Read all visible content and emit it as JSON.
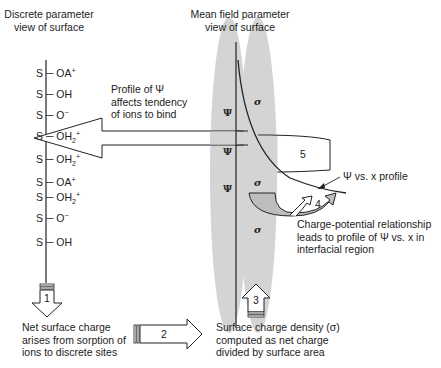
{
  "headers": {
    "discrete": [
      "Discrete parameter",
      "view of surface"
    ],
    "mean_field": [
      "Mean field parameter",
      "view of surface"
    ]
  },
  "surface_sites": [
    {
      "s": "S",
      "group": "OA",
      "charge": "+",
      "sub": ""
    },
    {
      "s": "S",
      "group": "OH",
      "charge": "",
      "sub": ""
    },
    {
      "s": "S",
      "group": "O",
      "charge": "−",
      "sub": ""
    },
    {
      "s": "S",
      "group": "OH",
      "charge": "+",
      "sub": "2"
    },
    {
      "s": "S",
      "group": "OH",
      "charge": "+",
      "sub": "2"
    },
    {
      "s": "S",
      "group": "OA",
      "charge": "+",
      "sub": ""
    },
    {
      "s": "S",
      "group": "OH",
      "charge": "+",
      "sub": "2"
    },
    {
      "s": "S",
      "group": "O",
      "charge": "−",
      "sub": ""
    },
    {
      "s": "S",
      "group": "OH",
      "charge": "",
      "sub": ""
    }
  ],
  "psi_symbol": "Ψ",
  "sigma_symbol": "σ",
  "annotations": {
    "profile_effect": [
      "Profile of Ψ",
      "affects tendency",
      "of ions to bind"
    ],
    "profile_label": "Ψ vs. x profile",
    "charge_potential": [
      "Charge-potential relationship",
      "leads to profile of Ψ vs. x in",
      "interfacial region"
    ],
    "net_charge": [
      "Net surface charge",
      "arises from sorption of",
      "ions to discrete sites"
    ],
    "charge_density": [
      "Surface charge density (σ)",
      "computed as net charge",
      "divided by surface area"
    ]
  },
  "steps": {
    "step1": "1",
    "step2": "2",
    "step3": "3",
    "step4": "4",
    "step5": "5"
  },
  "colors": {
    "ellipse_fill": "#d4d4d4",
    "line": "#222222",
    "arrow4_fill": "#bdbdbd"
  }
}
